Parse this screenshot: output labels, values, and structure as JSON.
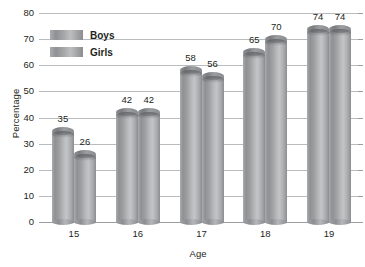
{
  "chart_data": {
    "type": "bar",
    "title": "",
    "xlabel": "Age",
    "ylabel": "Percentage",
    "categories": [
      "15",
      "16",
      "17",
      "18",
      "19"
    ],
    "series": [
      {
        "name": "Boys",
        "values": [
          35,
          42,
          58,
          65,
          74
        ]
      },
      {
        "name": "Girls",
        "values": [
          26,
          42,
          56,
          70,
          74
        ]
      }
    ],
    "yticks": [
      "0",
      "10",
      "20",
      "30",
      "40",
      "50",
      "60",
      "70",
      "80"
    ],
    "ylim": [
      0,
      80
    ],
    "grid": true,
    "legend_position": "top-left",
    "colors": {
      "boys": "#9fa1a3",
      "girls": "#9fa1a3",
      "gridline": "#b9bcbe",
      "text": "#231f20"
    }
  },
  "legend": {
    "items": [
      {
        "label": "Boys"
      },
      {
        "label": "Girls"
      }
    ]
  },
  "axes": {
    "y_title": "Percentage",
    "x_title": "Age"
  }
}
